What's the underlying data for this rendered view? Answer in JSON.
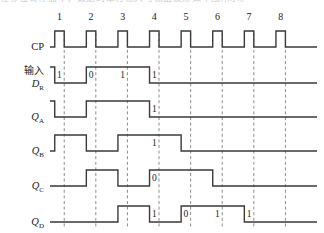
{
  "figure": {
    "kind": "digital-timing-diagram",
    "top_cutoff_text": "在移位寄存器中，数据的串行输入与输出波形如下图所示。",
    "colors": {
      "waveform": "#3a3a3a",
      "marker": "#8c8c8c",
      "text": "#1a1a1a",
      "background": "#ffffff"
    }
  },
  "chart_data": {
    "type": "line",
    "title": "",
    "xlabel": "",
    "ylabel": "",
    "grid": false,
    "legend": null,
    "x_axis": {
      "name": "clock pulse",
      "tick_labels": [
        "1",
        "2",
        "3",
        "4",
        "5",
        "6",
        "7",
        "8"
      ],
      "range": [
        0,
        8
      ]
    },
    "y_levels": {
      "low": 0,
      "high": 1
    },
    "signals": [
      {
        "name": "CP",
        "label": "CP",
        "label_type": "plain",
        "values": [
          1,
          1,
          1,
          1,
          1,
          1,
          1,
          1
        ],
        "annotations": []
      },
      {
        "name": "DR",
        "label": "输入",
        "label_line2_base": "D",
        "label_line2_sub": "R",
        "label_type": "cn-with-italic-sub",
        "values": [
          1,
          0,
          1,
          1,
          0,
          0,
          0,
          0
        ],
        "annotations": [
          {
            "slot": 1,
            "text": "1"
          },
          {
            "slot": 2,
            "text": "0"
          },
          {
            "slot": 3,
            "text": "1"
          },
          {
            "slot": 4,
            "text": "1"
          }
        ]
      },
      {
        "name": "QA",
        "label_base": "Q",
        "label_sub": "A",
        "label_type": "italic-sub",
        "values": [
          1,
          0,
          1,
          1,
          0,
          0,
          0,
          0
        ],
        "annotations": [
          {
            "slot": 4,
            "text": "1"
          }
        ]
      },
      {
        "name": "QB",
        "label_base": "Q",
        "label_sub": "B",
        "label_type": "italic-sub",
        "values": [
          0,
          1,
          0,
          1,
          1,
          0,
          0,
          0
        ],
        "annotations": [
          {
            "slot": 4,
            "text": "1"
          }
        ]
      },
      {
        "name": "QC",
        "label_base": "Q",
        "label_sub": "C",
        "label_type": "italic-sub",
        "values": [
          0,
          0,
          1,
          0,
          1,
          1,
          0,
          0
        ],
        "annotations": [
          {
            "slot": 4,
            "text": "0"
          }
        ]
      },
      {
        "name": "QD",
        "label_base": "Q",
        "label_sub": "D",
        "label_type": "italic-sub",
        "values": [
          0,
          0,
          0,
          1,
          0,
          1,
          1,
          0
        ],
        "annotations": [
          {
            "slot": 4,
            "text": "1"
          },
          {
            "slot": 5,
            "text": "0"
          },
          {
            "slot": 6,
            "text": "1"
          },
          {
            "slot": 7,
            "text": "1"
          }
        ]
      }
    ],
    "marker_lines": {
      "description": "vertical dashed lines at clock falling edges",
      "at_pulses": [
        1,
        2,
        3,
        4,
        5,
        6,
        7,
        8
      ]
    }
  }
}
